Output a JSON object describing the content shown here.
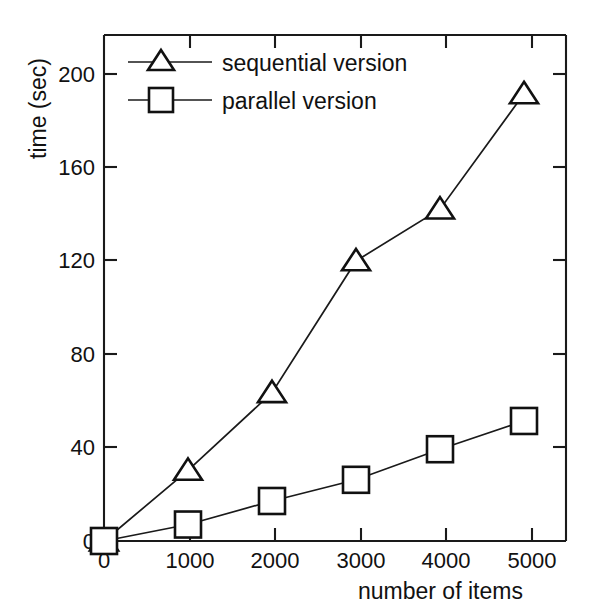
{
  "chart_data": {
    "type": "line",
    "title": "",
    "xlabel": "number of items",
    "ylabel": "time (sec)",
    "xlim": [
      0,
      5500
    ],
    "ylim": [
      0,
      215
    ],
    "xticks": [
      0,
      1000,
      2000,
      3000,
      4000,
      5000
    ],
    "xticklabels": [
      "0",
      "1000",
      "2000",
      "3000",
      "4000",
      "5000"
    ],
    "yticks": [
      0,
      40,
      80,
      120,
      160,
      200
    ],
    "yticklabels": [
      "0",
      "40",
      "80",
      "120",
      "160",
      "200"
    ],
    "grid": false,
    "legend_position": "upper left inside",
    "x": [
      0,
      1000,
      2000,
      3000,
      4000,
      5000
    ],
    "series": [
      {
        "name": "sequential version",
        "marker": "triangle-up",
        "values": [
          0,
          30,
          63,
          119,
          141,
          190
        ]
      },
      {
        "name": "parallel version",
        "marker": "square",
        "values": [
          0,
          7,
          17,
          26,
          39,
          51
        ]
      }
    ]
  },
  "axes": {
    "x_title": "number of items",
    "y_title": "time (sec)"
  },
  "legend": {
    "entries": [
      {
        "label": "sequential version",
        "marker": "triangle-up-icon"
      },
      {
        "label": "parallel version",
        "marker": "square-icon"
      }
    ]
  },
  "ticks": {
    "y": [
      "200",
      "160",
      "120",
      "80",
      "40",
      "0"
    ],
    "x": [
      "0",
      "1000",
      "2000",
      "3000",
      "4000",
      "5000"
    ]
  },
  "colors": {
    "ink": "#1a1a1a",
    "background": "#ffffff",
    "marker_fill": "#ffffff"
  }
}
